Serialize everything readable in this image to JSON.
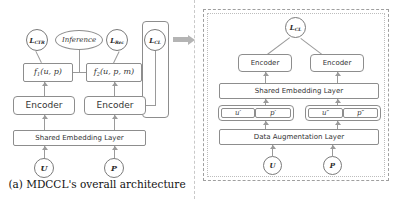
{
  "figure": {
    "caption": "(a) MDCCL's overall architecture",
    "colors": {
      "stroke": "#8d8d8d",
      "line": "#9a9a9a",
      "dashed_border": "#9f9f9f",
      "arrow": "#b4b4b4",
      "text": "#2b2b2b",
      "background": "#ffffff"
    }
  },
  "left_panel": {
    "name": "MDCCL overall architecture",
    "losses": [
      {
        "id": "l-ctr",
        "base": "L",
        "sub": "CTR"
      },
      {
        "id": "l-rec",
        "base": "L",
        "sub": "Rec"
      },
      {
        "id": "l-cl",
        "base": "L",
        "sub": "CL"
      }
    ],
    "inference_node": "Inference",
    "functions": [
      {
        "id": "f1",
        "base": "f",
        "sub": "1",
        "args": "(u, p)"
      },
      {
        "id": "f2",
        "base": "f",
        "sub": "2",
        "args": "(u, p, m)"
      }
    ],
    "encoders": [
      {
        "id": "encoder-left",
        "label": "Encoder"
      },
      {
        "id": "encoder-right",
        "label": "Encoder"
      }
    ],
    "shared_embedding_layer": "Shared Embedding Layer",
    "inputs": [
      {
        "id": "input-u",
        "label": "U"
      },
      {
        "id": "input-p",
        "label": "P"
      }
    ]
  },
  "right_panel": {
    "name": "Contrastive learning branch",
    "loss": {
      "base": "L",
      "sub": "CL"
    },
    "encoders": [
      {
        "id": "r-encoder-left",
        "label": "Encoder"
      },
      {
        "id": "r-encoder-right",
        "label": "Encoder"
      }
    ],
    "shared_embedding_layer": "Shared Embedding Layer",
    "views": [
      {
        "id": "view-1",
        "left": "u′",
        "right": "p′"
      },
      {
        "id": "view-2",
        "left": "u″",
        "right": "p″"
      }
    ],
    "data_augmentation_layer": "Data Augmentation Layer",
    "inputs": [
      {
        "id": "r-input-u",
        "label": "U"
      },
      {
        "id": "r-input-p",
        "label": "P"
      }
    ]
  }
}
